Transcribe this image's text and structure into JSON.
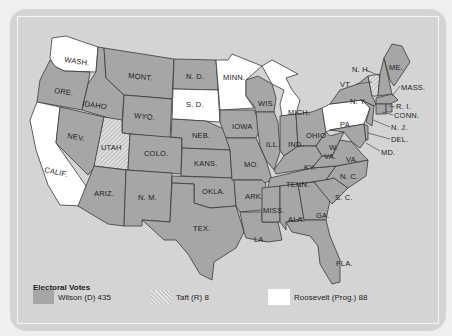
{
  "legend": {
    "title": "Electoral Votes",
    "items": [
      {
        "key": "wilson",
        "label": "Wilson (D) 435",
        "swatch": "gray"
      },
      {
        "key": "taft",
        "label": "Taft (R) 8",
        "swatch": "hatched"
      },
      {
        "key": "roosevelt",
        "label": "Roosevelt (Prog.) 88",
        "swatch": "white"
      }
    ]
  },
  "colors": {
    "wilson": "#a6a6a6",
    "taft": "hatched-light-gray",
    "roosevelt": "#ffffff",
    "background": "#d4d4d4"
  },
  "states": {
    "wash": "WASH.",
    "ore": "ORE.",
    "calif": "CALIF.",
    "idaho": "IDAHO",
    "nev": "NEV.",
    "mont": "MONT.",
    "wyo": "WYO.",
    "utah": "UTAH",
    "colo": "COLO.",
    "ariz": "ARIZ.",
    "nm": "N. M.",
    "nd": "N. D.",
    "sd": "S. D.",
    "neb": "NEB.",
    "kans": "KANS.",
    "okla": "OKLA.",
    "tex": "TEX.",
    "minn": "MINN.",
    "iowa": "IOWA",
    "mo": "MO.",
    "ark": "ARK.",
    "la": "LA.",
    "wis": "WIS.",
    "ill": "ILL.",
    "mich": "MICH.",
    "ind": "IND.",
    "ohio": "OHIO",
    "ky": "KY.",
    "tenn": "TENN.",
    "miss": "MISS.",
    "ala": "ALA.",
    "ga": "GA.",
    "fla": "FLA.",
    "sc": "S. C.",
    "nc": "N. C.",
    "va": "VA.",
    "wva": "W.",
    "wva2": "VA.",
    "md": "MD.",
    "del": "DEL.",
    "nj": "N. J.",
    "pa": "PA.",
    "ny": "N. Y.",
    "conn": "CONN.",
    "ri": "R. I.",
    "mass": "MASS.",
    "vt": "VT.",
    "nh": "N. H.",
    "me": "ME."
  }
}
